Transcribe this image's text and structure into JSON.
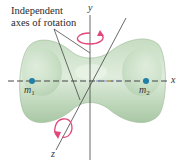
{
  "caption": {
    "line1": "Independent",
    "line2": "axes of rotation"
  },
  "axes": {
    "x_label": "x",
    "y_label": "y",
    "z_label": "z"
  },
  "masses": [
    {
      "symbol": "m",
      "subscript": "1"
    },
    {
      "symbol": "m",
      "subscript": "2"
    }
  ],
  "colors": {
    "body_fill": "#b9d4b5",
    "body_edge": "#8fb38b",
    "body_highlight": "#e3efe0",
    "axis_line": "#333333",
    "mass_dot": "#1f7fa6",
    "rotation_arrow": "#e2467a"
  },
  "icons": {
    "rotation_about_y": "curved-arrow-rotation-icon",
    "rotation_about_z": "curved-arrow-rotation-icon"
  }
}
